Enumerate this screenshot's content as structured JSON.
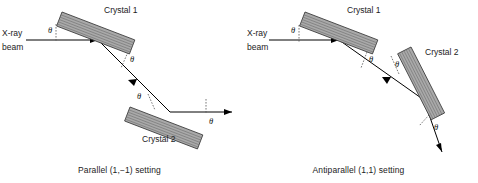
{
  "figure": {
    "background": "#ffffff",
    "crystal_fill": "#a9a9a9",
    "crystal_edge": "#3b3b3b",
    "beam_color": "#000000",
    "arc_color": "#555555"
  },
  "panels": [
    {
      "id": "parallel",
      "caption": "Parallel (1,−1) setting",
      "beam_label_line1": "X-ray",
      "beam_label_line2": "beam",
      "crystal1_label": "Crystal 1",
      "crystal2_label": "Crystal 2",
      "angles": [
        {
          "name": "theta-incident-crystal1",
          "symbol": "θ"
        },
        {
          "name": "theta-reflected-crystal1",
          "symbol": "θ"
        },
        {
          "name": "theta-incident-crystal2",
          "symbol": "θ"
        },
        {
          "name": "theta-reflected-crystal2",
          "symbol": "θ"
        }
      ]
    },
    {
      "id": "antiparallel",
      "caption": "Antiparallel (1,1) setting",
      "beam_label_line1": "X-ray",
      "beam_label_line2": "beam",
      "crystal1_label": "Crystal 1",
      "crystal2_label": "Crystal 2",
      "angles": [
        {
          "name": "theta-incident-crystal1",
          "symbol": "θ"
        },
        {
          "name": "theta-reflected-crystal1",
          "symbol": "θ"
        },
        {
          "name": "theta-incident-crystal2",
          "symbol": "θ"
        },
        {
          "name": "theta-reflected-crystal2",
          "symbol": "θ"
        }
      ]
    }
  ]
}
